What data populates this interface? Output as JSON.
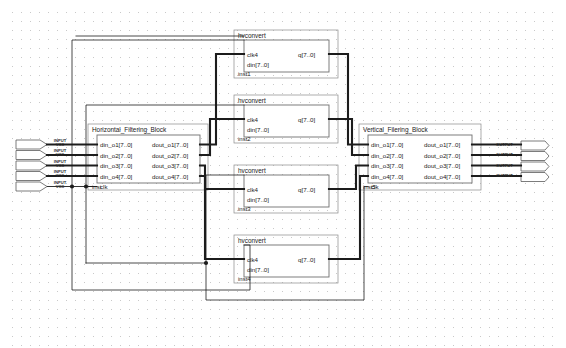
{
  "diagram": {
    "canvas": {
      "width": 566,
      "height": 348,
      "background": "#ffffff",
      "grid_color": "#c9c9c9"
    }
  },
  "input_pins": [
    {
      "type": "INPUT",
      "power": "VCC"
    },
    {
      "type": "INPUT",
      "power": "VCC"
    },
    {
      "type": "INPUT",
      "power": "VCC"
    },
    {
      "type": "INPUT",
      "power": "VCC"
    },
    {
      "type": "INPUT",
      "power": "VCC"
    }
  ],
  "output_pins": [
    {
      "type": "OUTPUT"
    },
    {
      "type": "OUTPUT"
    },
    {
      "type": "OUTPUT"
    },
    {
      "type": "OUTPUT"
    }
  ],
  "blocks": {
    "horizontal": {
      "title": "Horizontal_Filtering_Block",
      "instance": "inst",
      "inputs": [
        "din_o1[7..0]",
        "din_o2[7..0]",
        "din_o3[7..0]",
        "din_o4[7..0]",
        "clk"
      ],
      "outputs": [
        "dout_o1[7..0]",
        "dout_o2[7..0]",
        "dout_o3[7..0]",
        "dout_o4[7..0]"
      ]
    },
    "vertical": {
      "title": "Vertical_Filering_Block",
      "instance": "inst5",
      "inputs": [
        "din_o1[7..0]",
        "din_o2[7..0]",
        "din_o3[7..0]",
        "din_o4[7..0]",
        "clk"
      ],
      "outputs": [
        "dout_o1[7..0]",
        "dout_o2[7..0]",
        "dout_o3[7..0]",
        "dout_o4[7..0]"
      ]
    },
    "hvconvert": [
      {
        "title": "hvconvert",
        "instance": "inst1",
        "inputs": [
          "clk4",
          "din[7..0]"
        ],
        "outputs": [
          "q[7..0]"
        ]
      },
      {
        "title": "hvconvert",
        "instance": "inst2",
        "inputs": [
          "clk4",
          "din[7..0]"
        ],
        "outputs": [
          "q[7..0]"
        ]
      },
      {
        "title": "hvconvert",
        "instance": "inst3",
        "inputs": [
          "clk4",
          "din[7..0]"
        ],
        "outputs": [
          "q[7..0]"
        ]
      },
      {
        "title": "hvconvert",
        "instance": "inst4",
        "inputs": [
          "clk4",
          "din[7..0]"
        ],
        "outputs": [
          "q[7..0]"
        ]
      }
    ]
  },
  "colors": {
    "wire": "#1c1c1c",
    "bus": "#1c1c1c",
    "block_border": "#6f6f6f",
    "block_fill": "#ffffff",
    "outline": "#8a8a8a"
  }
}
